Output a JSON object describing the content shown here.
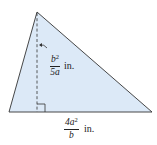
{
  "figure": {
    "type": "triangle",
    "fill_color": "#dce9f7",
    "stroke_color": "#333333",
    "height_label": {
      "numerator": "b",
      "numerator_exp": "2",
      "denominator": "5a",
      "unit": "in."
    },
    "base_label": {
      "numerator": "4a",
      "numerator_exp": "2",
      "denominator": "b",
      "unit": "in."
    },
    "right_angle_marker": true
  }
}
